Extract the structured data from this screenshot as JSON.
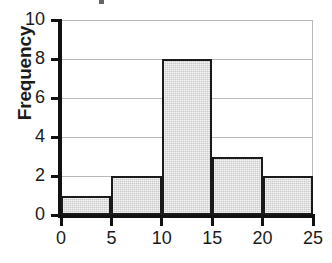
{
  "chart_data": {
    "type": "bar",
    "title": "",
    "xlabel": "",
    "ylabel": "Frequency",
    "bin_edges": [
      0,
      5,
      10,
      15,
      20,
      25
    ],
    "categories": [
      "0-5",
      "5-10",
      "10-15",
      "15-20",
      "20-25"
    ],
    "values": [
      1,
      2,
      8,
      3,
      2
    ],
    "xlim": [
      0,
      25
    ],
    "ylim": [
      0,
      10
    ],
    "xticks": [
      "0",
      "5",
      "10",
      "15",
      "20",
      "25"
    ],
    "yticks": [
      "0",
      "2",
      "4",
      "6",
      "8",
      "10"
    ],
    "grid": "horizontal",
    "legend": "none",
    "bar_fill_color": "#c9c9c9",
    "bar_edge_color": "#1a1a1a",
    "axis_color": "#111111",
    "gridline_color": "#b9b9b9",
    "background_color": "#ffffff"
  }
}
